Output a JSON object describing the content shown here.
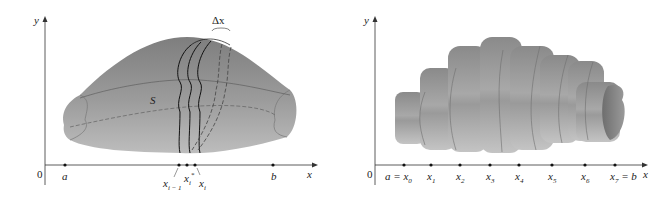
{
  "left_figure": {
    "axis_y_label": "y",
    "axis_x_label": "x",
    "origin_label": "0",
    "surface_label": "S",
    "delta_label": "Δx",
    "points": [
      {
        "label": "a",
        "x": 65
      },
      {
        "label": "x",
        "sub": "i − 1",
        "x": 179
      },
      {
        "label": "x",
        "sub": "i",
        "sup": "*",
        "x": 187
      },
      {
        "label": "x",
        "sub": "i",
        "x": 195
      },
      {
        "label": "b",
        "x": 273
      }
    ]
  },
  "right_figure": {
    "axis_y_label": "y",
    "axis_x_label": "x",
    "origin_label": "0",
    "points": [
      {
        "prefix": "a = ",
        "label": "x",
        "sub": "0",
        "x": 404
      },
      {
        "label": "x",
        "sub": "1",
        "x": 431
      },
      {
        "label": "x",
        "sub": "2",
        "x": 460
      },
      {
        "label": "x",
        "sub": "3",
        "x": 490
      },
      {
        "label": "x",
        "sub": "4",
        "x": 519
      },
      {
        "label": "x",
        "sub": "5",
        "x": 552
      },
      {
        "label": "x",
        "sub": "6",
        "x": 585
      },
      {
        "label": "x",
        "sub": "7",
        "suffix": " = b",
        "x": 615
      }
    ]
  },
  "colors": {
    "surface": "#8f8f8f",
    "surface_light": "#c9c9c9",
    "axis": "#333333"
  }
}
